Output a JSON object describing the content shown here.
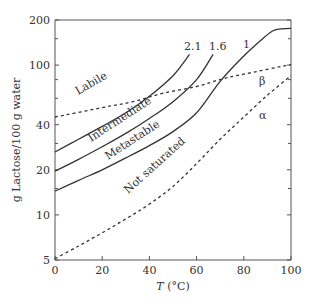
{
  "chart_data": {
    "type": "line",
    "title": "",
    "xlabel": "T (°C)",
    "xlabel_italic_part": "T",
    "xlabel_unit": "(°C)",
    "ylabel": "g Lactose/100 g water",
    "xlim": [
      0,
      100
    ],
    "ylim": [
      5,
      200
    ],
    "yscale": "log",
    "grid": false,
    "x_ticks": [
      0,
      20,
      40,
      60,
      80,
      100
    ],
    "x_tick_labels": [
      "0",
      "20",
      "40",
      "60",
      "80",
      "100"
    ],
    "y_ticks": [
      5,
      10,
      20,
      40,
      100,
      200
    ],
    "y_tick_labels": [
      "5",
      "10",
      "20",
      "40",
      "100",
      "200"
    ],
    "y_minor_ticks": [
      15,
      30,
      60,
      80,
      150
    ],
    "series": [
      {
        "name": "2.1",
        "style": "solid",
        "x": [
          0,
          10,
          20,
          30,
          40,
          50,
          57
        ],
        "y": [
          26.3,
          32,
          39,
          48,
          62,
          85,
          118
        ]
      },
      {
        "name": "1.6",
        "style": "solid",
        "x": [
          0,
          10,
          20,
          30,
          40,
          50,
          60,
          67
        ],
        "y": [
          19.6,
          23.5,
          28.5,
          35,
          44,
          57,
          80,
          118
        ]
      },
      {
        "name": "1",
        "style": "solid",
        "x": [
          0,
          10,
          20,
          30,
          40,
          50,
          60,
          70,
          80,
          88,
          92,
          95,
          100
        ],
        "y": [
          14.4,
          17,
          20,
          24,
          29,
          36,
          48,
          78,
          115,
          150,
          168,
          174,
          176
        ]
      },
      {
        "name": "β",
        "style": "dashed",
        "x": [
          0,
          20,
          33,
          46,
          60,
          71,
          80,
          100
        ],
        "y": [
          45,
          52,
          57,
          65,
          72,
          81,
          87,
          101
        ]
      },
      {
        "name": "α",
        "style": "dashed",
        "x": [
          0,
          10,
          20,
          30,
          40,
          50,
          60,
          70,
          80,
          90,
          100
        ],
        "y": [
          5.1,
          6.2,
          7.6,
          9.4,
          11.8,
          15.5,
          22,
          32,
          45,
          63,
          85
        ]
      }
    ],
    "annotations": [
      {
        "text": "Labile",
        "x": 10,
        "y": 70,
        "rotation": -30
      },
      {
        "text": "Intermediate",
        "x": 14,
        "y": 40,
        "rotation": -33
      },
      {
        "text": "Metastable",
        "x": 22,
        "y": 30,
        "rotation": -33
      },
      {
        "text": "Not saturated",
        "x": 31,
        "y": 20,
        "rotation": -40
      },
      {
        "text": "2.1",
        "x": 57,
        "y": 135
      },
      {
        "text": "1.6",
        "x": 68,
        "y": 135
      },
      {
        "text": "1",
        "x": 81,
        "y": 138
      },
      {
        "text": "β",
        "x": 88,
        "y": 80
      },
      {
        "text": "α",
        "x": 88,
        "y": 47
      }
    ]
  },
  "labels": {
    "region_labile": "Labile",
    "region_intermediate": "Intermediate",
    "region_metastable": "Metastable",
    "region_not_saturated": "Not saturated",
    "curve_2_1": "2.1",
    "curve_1_6": "1.6",
    "curve_1": "1",
    "curve_beta": "β",
    "curve_alpha": "α",
    "ylabel": "g Lactose/100 g water",
    "xlabel_T": "T",
    "xlabel_unit": " (°C)",
    "x_ticks": [
      "0",
      "20",
      "40",
      "60",
      "80",
      "100"
    ],
    "y_ticks": [
      "5",
      "10",
      "20",
      "40",
      "100",
      "200"
    ]
  }
}
